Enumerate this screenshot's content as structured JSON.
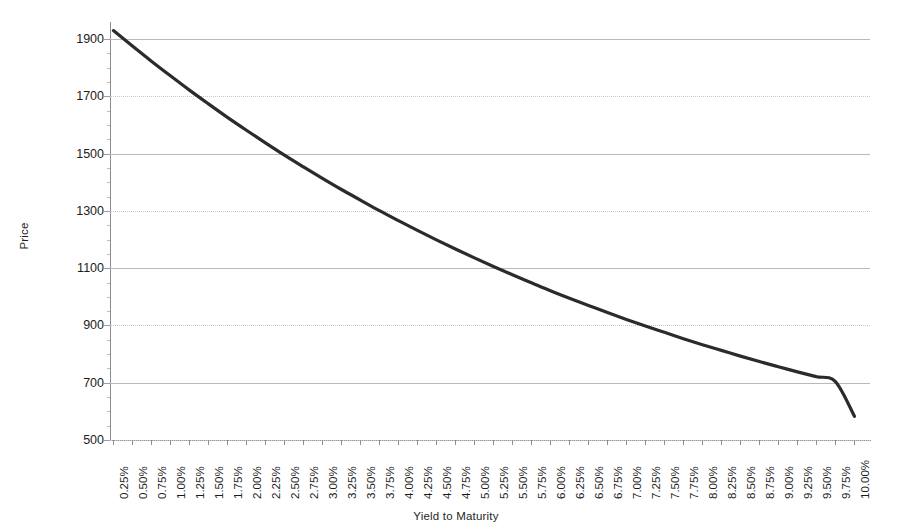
{
  "chart_data": {
    "type": "line",
    "title": "",
    "xlabel": "Yield to Maturity",
    "ylabel": "Price",
    "ylim": [
      500,
      1960
    ],
    "yticks": [
      500,
      700,
      900,
      1100,
      1300,
      1500,
      1700,
      1900
    ],
    "ytick_labels": [
      "500",
      "700",
      "900",
      "1100",
      "1300",
      "1500",
      "1700",
      "1900"
    ],
    "grid": true,
    "legend": "none",
    "line_color": "#2b2b2b",
    "gridline_color": "#bcbcbc",
    "categories": [
      "0.25%",
      "0.50%",
      "0.75%",
      "1.00%",
      "1.25%",
      "1.50%",
      "1.75%",
      "2.00%",
      "2.25%",
      "2.50%",
      "2.75%",
      "3.00%",
      "3.25%",
      "3.50%",
      "3.75%",
      "4.00%",
      "4.25%",
      "4.50%",
      "4.75%",
      "5.00%",
      "5.25%",
      "5.50%",
      "5.75%",
      "6.00%",
      "6.25%",
      "6.50%",
      "6.75%",
      "7.00%",
      "7.25%",
      "7.50%",
      "7.75%",
      "8.00%",
      "8.25%",
      "8.50%",
      "8.75%",
      "9.00%",
      "9.25%",
      "9.50%",
      "9.75%",
      "10.00%"
    ],
    "values": [
      1930,
      1876,
      1823,
      1772,
      1722,
      1674,
      1627,
      1582,
      1538,
      1495,
      1454,
      1414,
      1375,
      1338,
      1301,
      1266,
      1232,
      1199,
      1167,
      1136,
      1106,
      1077,
      1049,
      1021,
      995,
      970,
      945,
      921,
      898,
      876,
      854,
      833,
      813,
      793,
      774,
      756,
      738,
      721,
      704,
      583
    ],
    "series_name": "Price vs Yield"
  }
}
